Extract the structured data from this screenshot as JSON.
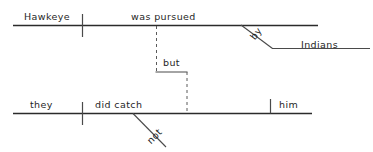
{
  "diagram": {
    "type": "reed-kellogg-sentence-diagram",
    "sentence": "Hawkeye was pursued by Indians but they did not catch him",
    "background_color": "#ffffff",
    "line_color": "#2b2b2b",
    "clauses": [
      {
        "id": "clause-1",
        "subject": "Hawkeye",
        "predicate": "was pursued",
        "modifier_preposition": "by",
        "object_of_preposition": "Indians"
      },
      {
        "id": "clause-2",
        "subject": "they",
        "predicate": "did catch",
        "adverb": "not",
        "direct_object": "him"
      }
    ],
    "conjunction": "but",
    "words": {
      "subject_top": "Hawkeye",
      "verb_top": "was pursued",
      "preposition": "by",
      "prep_object": "Indians",
      "conjunction": "but",
      "subject_bottom": "they",
      "verb_bottom": "did catch",
      "adverb": "not",
      "direct_object": "him"
    }
  }
}
